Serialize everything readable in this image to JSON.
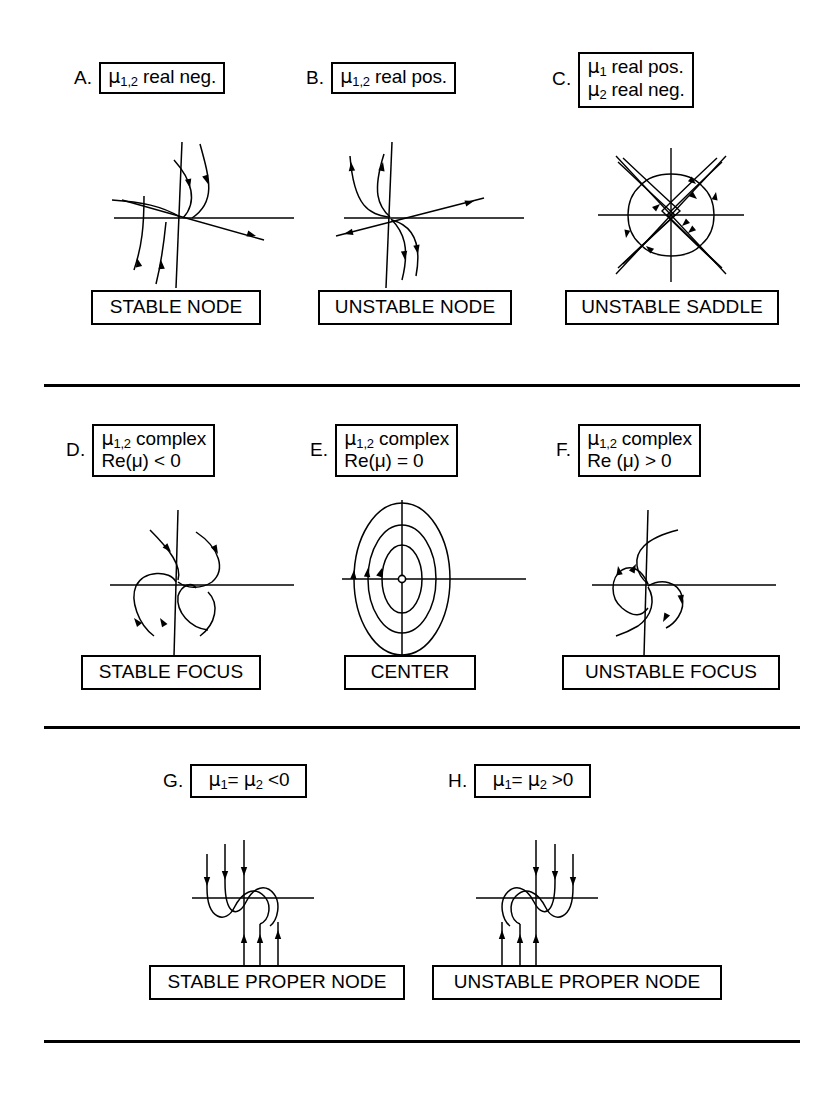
{
  "figure": {
    "background_color": "#ffffff",
    "line_color": "#000000",
    "width": 834,
    "height": 1096
  },
  "sections": [
    {
      "name": "real-eigenvalues",
      "divider_after": true
    },
    {
      "name": "complex-eigenvalues",
      "divider_after": true
    },
    {
      "name": "repeated-eigenvalues",
      "divider_after": true
    }
  ],
  "panels": [
    {
      "id": "A",
      "letter": "A.",
      "condition_lines": [
        "μ1,2 real neg."
      ],
      "condition_html_lines": [
        {
          "mu": "μ",
          "sub": "1,2",
          "rest": " real neg."
        }
      ],
      "name": "STABLE NODE",
      "diagram": "stable-node"
    },
    {
      "id": "B",
      "letter": "B.",
      "condition_lines": [
        "μ1,2 real pos."
      ],
      "condition_html_lines": [
        {
          "mu": "μ",
          "sub": "1,2",
          "rest": " real pos."
        }
      ],
      "name": "UNSTABLE NODE",
      "diagram": "unstable-node"
    },
    {
      "id": "C",
      "letter": "C.",
      "condition_lines": [
        "μ1 real pos.",
        "μ2 real neg."
      ],
      "condition_html_lines": [
        {
          "mu": "μ",
          "sub": "1",
          "rest": " real pos."
        },
        {
          "mu": "μ",
          "sub": "2",
          "rest": " real neg."
        }
      ],
      "name": "UNSTABLE SADDLE",
      "diagram": "saddle"
    },
    {
      "id": "D",
      "letter": "D.",
      "condition_lines": [
        "μ1,2 complex",
        "Re(μ) < 0"
      ],
      "condition_html_lines": [
        {
          "mu": "μ",
          "sub": "1,2",
          "rest": " complex"
        },
        {
          "mu": "",
          "sub": "",
          "rest": "Re(μ) < 0"
        }
      ],
      "name": "STABLE FOCUS",
      "diagram": "stable-focus"
    },
    {
      "id": "E",
      "letter": "E.",
      "condition_lines": [
        "μ1,2 complex",
        "Re(μ) = 0"
      ],
      "condition_html_lines": [
        {
          "mu": "μ",
          "sub": "1,2",
          "rest": " complex"
        },
        {
          "mu": "",
          "sub": "",
          "rest": "Re(μ) = 0"
        }
      ],
      "name": "CENTER",
      "diagram": "center"
    },
    {
      "id": "F",
      "letter": "F.",
      "condition_lines": [
        "μ1,2 complex",
        "Re (μ) > 0"
      ],
      "condition_html_lines": [
        {
          "mu": "μ",
          "sub": "1,2",
          "rest": " complex"
        },
        {
          "mu": "",
          "sub": "",
          "rest": "Re (μ) > 0"
        }
      ],
      "name": "UNSTABLE FOCUS",
      "diagram": "unstable-focus"
    },
    {
      "id": "G",
      "letter": "G.",
      "condition_lines": [
        "μ1= μ2 <0"
      ],
      "condition_html_lines": [
        {
          "mu": "μ",
          "sub": "1",
          "rest": "= ",
          "mu2": "μ",
          "sub2": "2",
          "rest2": " <0"
        }
      ],
      "name": "STABLE PROPER NODE",
      "diagram": "stable-proper-node"
    },
    {
      "id": "H",
      "letter": "H.",
      "condition_lines": [
        "μ1= μ2 >0"
      ],
      "condition_html_lines": [
        {
          "mu": "μ",
          "sub": "1",
          "rest": "= ",
          "mu2": "μ",
          "sub2": "2",
          "rest2": " >0"
        }
      ],
      "name": "UNSTABLE PROPER NODE",
      "diagram": "unstable-proper-node"
    }
  ],
  "text": {
    "A": {
      "letter": "A.",
      "mu": "μ",
      "sub": "1,2",
      "rest": " real neg.",
      "name": "STABLE NODE"
    },
    "B": {
      "letter": "B.",
      "mu": "μ",
      "sub": "1,2",
      "rest": " real pos.",
      "name": "UNSTABLE NODE"
    },
    "C": {
      "letter": "C.",
      "mu1": "μ",
      "sub1": "1",
      "rest1": " real pos.",
      "mu2": "μ",
      "sub2": "2",
      "rest2": " real neg.",
      "name": "UNSTABLE SADDLE"
    },
    "D": {
      "letter": "D.",
      "mu": "μ",
      "sub": "1,2",
      "rest": " complex",
      "line2": "Re(μ) < 0",
      "name": "STABLE FOCUS"
    },
    "E": {
      "letter": "E.",
      "mu": "μ",
      "sub": "1,2",
      "rest": " complex",
      "line2": "Re(μ) = 0",
      "name": "CENTER"
    },
    "F": {
      "letter": "F.",
      "mu": "μ",
      "sub": "1,2",
      "rest": " complex",
      "line2": "Re (μ) > 0",
      "name": "UNSTABLE FOCUS"
    },
    "G": {
      "letter": "G.",
      "mu1": "μ",
      "sub1": "1",
      "eq": "= ",
      "mu2": "μ",
      "sub2": "2",
      "rest2": " <0",
      "name": "STABLE PROPER NODE"
    },
    "H": {
      "letter": "H.",
      "mu1": "μ",
      "sub1": "1",
      "eq": "= ",
      "mu2": "μ",
      "sub2": "2",
      "rest2": " >0",
      "name": "UNSTABLE PROPER NODE"
    }
  }
}
